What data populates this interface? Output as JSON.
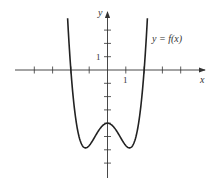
{
  "chart_data": {
    "type": "line",
    "title": "",
    "xlabel": "x",
    "ylabel": "y",
    "curve_label": "y = f(x)",
    "function": "f(x) ≈ 0.89x^4 − 2.57x^2 − 4",
    "x_tick_label": "1",
    "y_tick_label": "1",
    "x_ticks": [
      -4,
      -3,
      -2,
      -1,
      0,
      1,
      2,
      3,
      4
    ],
    "y_ticks": [
      3,
      2,
      1,
      -1,
      -2,
      -3,
      -4,
      -5,
      -6,
      -7
    ],
    "xlim": [
      -4.8,
      5
    ],
    "ylim": [
      -8,
      4
    ],
    "grid": false,
    "key_points": {
      "roots": [
        [
          -2,
          0
        ],
        [
          2,
          0
        ]
      ],
      "local_max": [
        0,
        -4
      ],
      "local_min": [
        [
          -1.2,
          -5.9
        ],
        [
          1.2,
          -5.9
        ]
      ]
    },
    "series": [
      {
        "name": "f(x)",
        "x": [
          -2.1,
          -2.0,
          -1.8,
          -1.6,
          -1.4,
          -1.2,
          -1.0,
          -0.8,
          -0.6,
          -0.4,
          -0.2,
          0,
          0.2,
          0.4,
          0.6,
          0.8,
          1.0,
          1.2,
          1.4,
          1.6,
          1.8,
          2.0,
          2.1
        ],
        "y": [
          0.5,
          0.0,
          -2.5,
          -4.7,
          -5.6,
          -5.9,
          -5.7,
          -5.3,
          -4.8,
          -4.4,
          -4.1,
          -4.0,
          -4.1,
          -4.4,
          -4.8,
          -5.3,
          -5.7,
          -5.9,
          -5.6,
          -4.7,
          -2.5,
          0.0,
          0.5
        ]
      }
    ]
  },
  "labels": {
    "x_axis": "x",
    "y_axis": "y",
    "curve": "y = f(x)",
    "x_one": "1",
    "y_one": "1"
  }
}
